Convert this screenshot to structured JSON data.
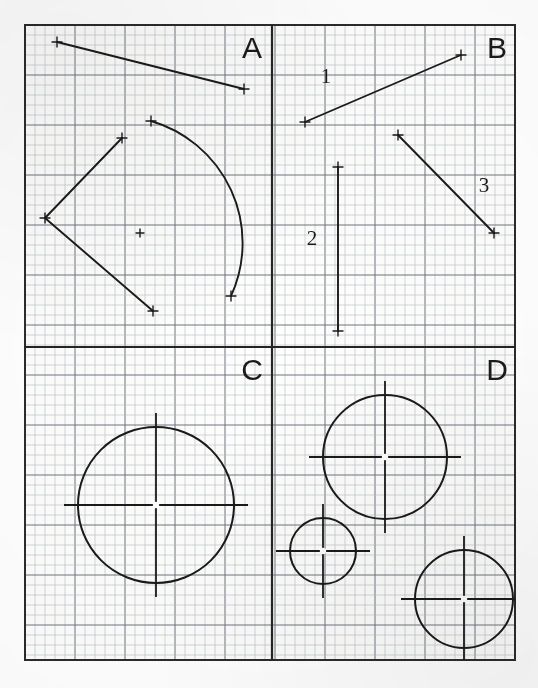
{
  "sheet": {
    "width": 538,
    "height": 688,
    "background_color": "#ffffff",
    "paper_tint": "#fdfdfb",
    "frame": {
      "x": 25,
      "y": 25,
      "width": 490,
      "height": 635,
      "stroke_color": "#2b2b2b",
      "stroke_width": 2.0
    },
    "grid": {
      "minor_spacing": 10,
      "major_every": 5,
      "minor_color": "#b9bcc4",
      "major_color": "#6f7480",
      "minor_width": 0.6,
      "major_width": 1.0
    },
    "dividers": {
      "vertical_x": 272,
      "horizontal_y": 347,
      "stroke_color": "#242424",
      "stroke_width": 2.2
    },
    "ink_color": "#1a1a1a"
  },
  "panels": [
    {
      "id": "A",
      "label": "A",
      "label_x": 252,
      "label_y": 58,
      "quadrant": "top-left"
    },
    {
      "id": "B",
      "label": "B",
      "label_x": 497,
      "label_y": 58,
      "quadrant": "top-right"
    },
    {
      "id": "C",
      "label": "C",
      "label_x": 252,
      "label_y": 380,
      "quadrant": "bottom-left"
    },
    {
      "id": "D",
      "label": "D",
      "label_x": 497,
      "label_y": 380,
      "quadrant": "bottom-right"
    }
  ],
  "panel_a": {
    "straight_line": {
      "x1": 57,
      "y1": 42,
      "x2": 244,
      "y2": 89
    },
    "polyline": {
      "points": "122,138 45,218 153,311"
    },
    "arc": {
      "start_x": 151,
      "start_y": 121,
      "end_x": 231,
      "end_y": 296,
      "radius": 127,
      "large_arc": 0,
      "sweep": 1
    },
    "center_mark": {
      "x": 140,
      "y": 233,
      "size": 4
    },
    "tick_points": [
      {
        "x": 57,
        "y": 42
      },
      {
        "x": 244,
        "y": 89
      },
      {
        "x": 122,
        "y": 138
      },
      {
        "x": 45,
        "y": 218
      },
      {
        "x": 153,
        "y": 311
      },
      {
        "x": 151,
        "y": 121
      },
      {
        "x": 231,
        "y": 296
      }
    ]
  },
  "panel_b": {
    "lines": [
      {
        "name": "1",
        "x1": 305,
        "y1": 122,
        "x2": 461,
        "y2": 55,
        "label": "1",
        "label_x": 326,
        "label_y": 83
      },
      {
        "name": "2",
        "x1": 338,
        "y1": 167,
        "x2": 338,
        "y2": 331,
        "label": "2",
        "label_x": 312,
        "label_y": 245
      },
      {
        "name": "3",
        "x1": 398,
        "y1": 135,
        "x2": 494,
        "y2": 233,
        "label": "3",
        "label_x": 484,
        "label_y": 192
      }
    ],
    "tick_points": [
      {
        "x": 305,
        "y": 122
      },
      {
        "x": 461,
        "y": 55
      },
      {
        "x": 338,
        "y": 167
      },
      {
        "x": 338,
        "y": 331
      },
      {
        "x": 398,
        "y": 135
      },
      {
        "x": 494,
        "y": 233
      }
    ]
  },
  "panel_c": {
    "circles": [
      {
        "cx": 156,
        "cy": 505,
        "r": 78,
        "crosshair_overhang": 14
      }
    ]
  },
  "panel_d": {
    "circles": [
      {
        "cx": 385,
        "cy": 457,
        "r": 62,
        "crosshair_overhang": 14
      },
      {
        "cx": 323,
        "cy": 551,
        "r": 33,
        "crosshair_overhang": 14
      },
      {
        "cx": 464,
        "cy": 599,
        "r": 49,
        "crosshair_overhang": 14
      }
    ]
  },
  "chart_data": {
    "type": "scatter",
    "title": "",
    "xlabel": "",
    "ylabel": "",
    "quadrants": [
      {
        "label": "A",
        "elements": [
          {
            "type": "line",
            "endpoints": [
              [
                57,
                42
              ],
              [
                244,
                89
              ]
            ]
          },
          {
            "type": "polyline",
            "vertices": [
              [
                122,
                138
              ],
              [
                45,
                218
              ],
              [
                153,
                311
              ]
            ]
          },
          {
            "type": "arc",
            "from": [
              151,
              121
            ],
            "to": [
              231,
              296
            ],
            "radius": 127,
            "center_mark": [
              140,
              233
            ]
          }
        ]
      },
      {
        "label": "B",
        "elements": [
          {
            "type": "line",
            "id": "1",
            "endpoints": [
              [
                305,
                122
              ],
              [
                461,
                55
              ]
            ]
          },
          {
            "type": "line",
            "id": "2",
            "endpoints": [
              [
                338,
                167
              ],
              [
                338,
                331
              ]
            ]
          },
          {
            "type": "line",
            "id": "3",
            "endpoints": [
              [
                398,
                135
              ],
              [
                494,
                233
              ]
            ]
          }
        ]
      },
      {
        "label": "C",
        "elements": [
          {
            "type": "circle",
            "center": [
              156,
              505
            ],
            "radius": 78
          }
        ]
      },
      {
        "label": "D",
        "elements": [
          {
            "type": "circle",
            "center": [
              385,
              457
            ],
            "radius": 62
          },
          {
            "type": "circle",
            "center": [
              323,
              551
            ],
            "radius": 33
          },
          {
            "type": "circle",
            "center": [
              464,
              599
            ],
            "radius": 49
          }
        ]
      }
    ]
  }
}
